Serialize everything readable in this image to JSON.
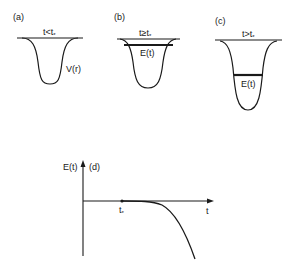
{
  "panels": [
    {
      "id": "a",
      "tag": "(a)",
      "condition": "t<t",
      "condition_sub": "*",
      "curve_label": "V(r)"
    },
    {
      "id": "b",
      "tag": "(b)",
      "condition": "t≥t",
      "condition_sub": "*",
      "level_label": "E(t)"
    },
    {
      "id": "c",
      "tag": "(c)",
      "condition": "t>t",
      "condition_sub": "*",
      "level_label": "E(t)"
    }
  ],
  "plot_d": {
    "tag": "(d)",
    "y_label": "E(t)",
    "x_label": "t",
    "marker_label": "t",
    "marker_sub": "*"
  },
  "colors": {
    "ink": "#1a1a1a",
    "background": "#ffffff"
  }
}
